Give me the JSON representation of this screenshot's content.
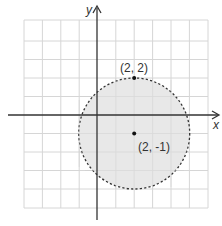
{
  "graph": {
    "x_axis_label": "x",
    "y_axis_label": "y",
    "grid": {
      "x_min": -4,
      "x_max": 6,
      "y_min": -6,
      "y_max": 4,
      "step": 1
    },
    "circle": {
      "center": [
        2,
        -1
      ],
      "radius": 3,
      "style": "dashed",
      "fill": "#e8e8e8",
      "stroke": "#333333"
    },
    "points": [
      {
        "label": "(2, 2)",
        "x": 2,
        "y": 2
      },
      {
        "label": "(2, -1)",
        "x": 2,
        "y": -1
      }
    ]
  }
}
